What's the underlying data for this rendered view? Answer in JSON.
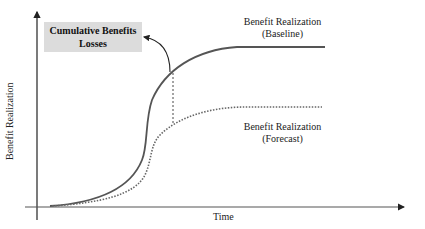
{
  "diagram": {
    "callout": {
      "line1": "Cumulative Benefits",
      "line2": "Losses",
      "fill": "#dcdcdc"
    },
    "axes": {
      "x_label": "Time",
      "y_label": "Benefit Realization"
    },
    "curves": [
      {
        "name": "baseline",
        "label_line1": "Benefit Realization",
        "label_line2": "(Baseline)",
        "style": "solid",
        "color": "#555555"
      },
      {
        "name": "forecast",
        "label_line1": "Benefit Realization",
        "label_line2": "(Forecast)",
        "style": "dotted",
        "color": "#666666"
      }
    ],
    "connector": {
      "style": "dashed vertical gap indicator with curved arrow to callout"
    }
  }
}
